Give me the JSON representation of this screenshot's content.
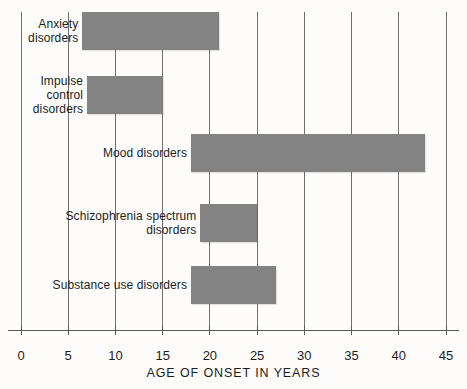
{
  "chart_data": {
    "type": "bar",
    "orientation": "horizontal",
    "title": "",
    "subtitle": "",
    "xlabel": "AGE OF ONSET IN YEARS",
    "ylabel": "",
    "xlim": [
      0,
      45
    ],
    "xticks": [
      0,
      5,
      10,
      15,
      20,
      25,
      30,
      35,
      40,
      45
    ],
    "xtick_labels": [
      "0",
      "5",
      "10",
      "15",
      "20",
      "25",
      "30",
      "35",
      "40",
      "45"
    ],
    "grid": true,
    "grid_axis": "x",
    "legend": false,
    "bar_style": "range",
    "categories": [
      "Anxiety\ndisorders",
      "Impulse\ncontrol\ndisorders",
      "Mood disorders",
      "Schizophrenia spectrum\ndisorders",
      "Substance use disorders"
    ],
    "ranges": [
      {
        "label": "Anxiety disorders",
        "start": 6.5,
        "end": 21.0
      },
      {
        "label": "Impulse control disorders",
        "start": 7.0,
        "end": 15.0
      },
      {
        "label": "Mood disorders",
        "start": 18.0,
        "end": 42.8
      },
      {
        "label": "Schizophrenia spectrum disorders",
        "start": 19.0,
        "end": 25.0
      },
      {
        "label": "Substance use disorders",
        "start": 18.0,
        "end": 27.0
      }
    ],
    "bar_color": "#838383",
    "grid_color": "#6f6f6f",
    "axis_color": "#5a5a5a",
    "background_color": "#fdfcfb"
  }
}
